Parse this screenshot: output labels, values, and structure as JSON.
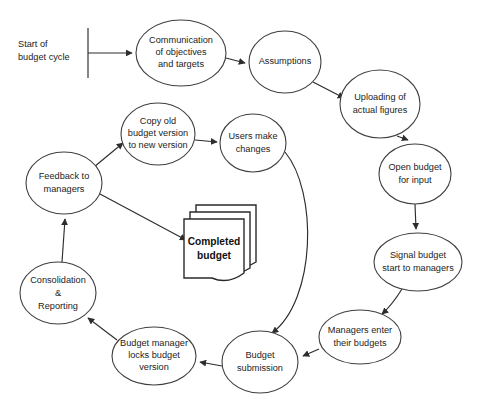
{
  "diagram": {
    "background_color": "#ffffff",
    "stroke_color": "#2d2d2d",
    "start_label_line1": "Start of",
    "start_label_line2": "budget cycle",
    "document": {
      "name": "completed-budget-document",
      "line1": "Completed",
      "line2": "budget"
    },
    "nodes": [
      {
        "id": "communication",
        "name": "node-communication-of-objectives-and-targets",
        "shape": "ellipse",
        "lines": [
          "Communication",
          "of objectives",
          "and targets"
        ],
        "cx": 181,
        "cy": 53,
        "rx": 45,
        "ry": 33
      },
      {
        "id": "assumptions",
        "name": "node-assumptions",
        "shape": "ellipse",
        "lines": [
          "Assumptions"
        ],
        "cx": 285,
        "cy": 62,
        "rx": 36,
        "ry": 31
      },
      {
        "id": "uploading",
        "name": "node-uploading-of-actual-figures",
        "shape": "ellipse",
        "lines": [
          "Uploading of",
          "actual figures"
        ],
        "cx": 380,
        "cy": 104,
        "rx": 40,
        "ry": 34
      },
      {
        "id": "open-budget",
        "name": "node-open-budget-for-input",
        "shape": "ellipse",
        "lines": [
          "Open budget",
          "for input"
        ],
        "cx": 415,
        "cy": 174,
        "rx": 36,
        "ry": 30
      },
      {
        "id": "signal-budget",
        "name": "node-signal-budget-start-to-managers",
        "shape": "ellipse",
        "lines": [
          "Signal budget",
          "start to managers"
        ],
        "cx": 418,
        "cy": 262,
        "rx": 44,
        "ry": 29
      },
      {
        "id": "managers-enter",
        "name": "node-managers-enter-their-budgets",
        "shape": "ellipse",
        "lines": [
          "Managers enter",
          "their budgets"
        ],
        "cx": 360,
        "cy": 337,
        "rx": 41,
        "ry": 27
      },
      {
        "id": "budget-submission",
        "name": "node-budget-submission",
        "shape": "ellipse",
        "lines": [
          "Budget",
          "submission"
        ],
        "cx": 260,
        "cy": 362,
        "rx": 38,
        "ry": 31
      },
      {
        "id": "budget-manager-locks",
        "name": "node-budget-manager-locks-budget-version",
        "shape": "ellipse",
        "lines": [
          "Budget manager",
          "locks budget",
          "version"
        ],
        "cx": 154,
        "cy": 356,
        "rx": 42,
        "ry": 29
      },
      {
        "id": "consolidation",
        "name": "node-consolidation-and-reporting",
        "shape": "ellipse",
        "lines": [
          "Consolidation",
          "&",
          "Reporting"
        ],
        "cx": 58,
        "cy": 293,
        "rx": 38,
        "ry": 31
      },
      {
        "id": "feedback",
        "name": "node-feedback-to-managers",
        "shape": "ellipse",
        "lines": [
          "Feedback to",
          "managers"
        ],
        "cx": 64,
        "cy": 183,
        "rx": 38,
        "ry": 31
      },
      {
        "id": "copy-old",
        "name": "node-copy-old-budget-version-to-new-version",
        "shape": "ellipse",
        "lines": [
          "Copy old",
          "budget version",
          "to new version"
        ],
        "cx": 158,
        "cy": 134,
        "rx": 37,
        "ry": 31
      },
      {
        "id": "users-make-changes",
        "name": "node-users-make-changes",
        "shape": "ellipse",
        "lines": [
          "Users make",
          "changes"
        ],
        "cx": 253,
        "cy": 143,
        "rx": 33,
        "ry": 29
      }
    ],
    "edges": [
      {
        "id": "start-to-communication",
        "name": "edge-start-to-communication",
        "from": "start",
        "to": "communication"
      },
      {
        "id": "communication-to-assumptions",
        "name": "edge-communication-to-assumptions",
        "from": "communication",
        "to": "assumptions"
      },
      {
        "id": "assumptions-to-uploading",
        "name": "edge-assumptions-to-uploading",
        "from": "assumptions",
        "to": "uploading"
      },
      {
        "id": "uploading-to-open-budget",
        "name": "edge-uploading-to-open-budget",
        "from": "uploading",
        "to": "open-budget"
      },
      {
        "id": "open-budget-to-signal",
        "name": "edge-open-budget-to-signal",
        "from": "open-budget",
        "to": "signal-budget"
      },
      {
        "id": "signal-to-managers-enter",
        "name": "edge-signal-to-managers-enter",
        "from": "signal-budget",
        "to": "managers-enter"
      },
      {
        "id": "managers-enter-to-submission",
        "name": "edge-managers-enter-to-budget-submission",
        "from": "managers-enter",
        "to": "budget-submission"
      },
      {
        "id": "submission-to-locks",
        "name": "edge-budget-submission-to-budget-manager-locks",
        "from": "budget-submission",
        "to": "budget-manager-locks"
      },
      {
        "id": "locks-to-consolidation",
        "name": "edge-budget-manager-locks-to-consolidation",
        "from": "budget-manager-locks",
        "to": "consolidation"
      },
      {
        "id": "consolidation-to-feedback",
        "name": "edge-consolidation-to-feedback",
        "from": "consolidation",
        "to": "feedback"
      },
      {
        "id": "feedback-to-copy-old",
        "name": "edge-feedback-to-copy-old",
        "from": "feedback",
        "to": "copy-old"
      },
      {
        "id": "copy-old-to-users",
        "name": "edge-copy-old-to-users-make-changes",
        "from": "copy-old",
        "to": "users-make-changes"
      },
      {
        "id": "feedback-to-document",
        "name": "edge-feedback-to-completed-budget",
        "from": "feedback",
        "to": "completed-budget"
      },
      {
        "id": "users-to-submission",
        "name": "edge-users-make-changes-to-budget-submission",
        "from": "users-make-changes",
        "to": "budget-submission"
      }
    ]
  }
}
